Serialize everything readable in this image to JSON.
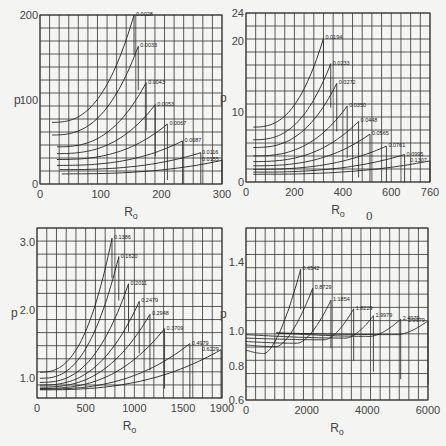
{
  "chart_data": [
    {
      "type": "line",
      "panel": "top-left",
      "xlabel": "R_o",
      "ylabel": "p",
      "xlim": [
        0,
        300
      ],
      "ylim": [
        0,
        200
      ],
      "xticks": [
        "0",
        "100",
        "200",
        "300"
      ],
      "yticks": [
        "0",
        "100",
        "200"
      ],
      "grid": true,
      "box": {
        "x0": 40,
        "y0": 15,
        "x1": 222,
        "y1": 184
      },
      "series": [
        {
          "name": "0.0028",
          "x0": 20,
          "xend": 155,
          "ystart": 73,
          "yend": 200
        },
        {
          "name": "0.0033",
          "x0": 20,
          "xend": 162,
          "ystart": 58,
          "yend": 163
        },
        {
          "name": "0.0043",
          "x0": 28,
          "xend": 175,
          "ystart": 44,
          "yend": 120
        },
        {
          "name": "0.0053",
          "x0": 28,
          "xend": 190,
          "ystart": 36,
          "yend": 94
        },
        {
          "name": "0.0067",
          "x0": 28,
          "xend": 210,
          "ystart": 29,
          "yend": 71
        },
        {
          "name": "0.0087",
          "x0": 28,
          "xend": 235,
          "ystart": 22,
          "yend": 51
        },
        {
          "name": "0.0116",
          "x0": 33,
          "xend": 265,
          "ystart": 17,
          "yend": 37
        },
        {
          "name": "0.0155",
          "x0": 36,
          "xend": 300,
          "ystart": 12,
          "yend": 28
        }
      ]
    },
    {
      "type": "line",
      "panel": "top-right",
      "xlabel": "R_o",
      "ylabel": "p",
      "xlim": [
        0,
        760
      ],
      "ylim": [
        0,
        24
      ],
      "xticks": [
        "0",
        "200",
        "400",
        "600",
        "760"
      ],
      "yticks": [
        "0",
        "10",
        "20",
        "24"
      ],
      "grid": true,
      "box": {
        "x0": 246,
        "y0": 13,
        "x1": 430,
        "y1": 182
      },
      "series": [
        {
          "name": "0.0194",
          "x0": 30,
          "xend": 320,
          "ystart": 7.8,
          "yend": 20.4
        },
        {
          "name": "0.0233",
          "x0": 30,
          "xend": 350,
          "ystart": 6.0,
          "yend": 16.8
        },
        {
          "name": "0.0272",
          "x0": 30,
          "xend": 375,
          "ystart": 4.9,
          "yend": 14.0
        },
        {
          "name": "0.0350",
          "x0": 30,
          "xend": 418,
          "ystart": 3.7,
          "yend": 10.8
        },
        {
          "name": "0.0448",
          "x0": 30,
          "xend": 465,
          "ystart": 2.9,
          "yend": 8.6
        },
        {
          "name": "0.0565",
          "x0": 30,
          "xend": 512,
          "ystart": 2.3,
          "yend": 6.8
        },
        {
          "name": "0.0761",
          "x0": 30,
          "xend": 580,
          "ystart": 1.8,
          "yend": 5.1
        },
        {
          "name": "0.0995",
          "x0": 30,
          "xend": 655,
          "ystart": 1.4,
          "yend": 3.9
        },
        {
          "name": "0.1307",
          "x0": 30,
          "xend": 760,
          "ystart": 1.1,
          "yend": 3.0
        }
      ]
    },
    {
      "type": "line",
      "panel": "bottom-left",
      "xlabel": "R_o",
      "ylabel": "p",
      "xlim": [
        0,
        1900
      ],
      "ylim": [
        0.7,
        3.2
      ],
      "xticks": [
        "0",
        "500",
        "1000",
        "1500",
        "1900"
      ],
      "yticks": [
        "1.0",
        "2.0",
        "3.0"
      ],
      "grid": true,
      "box": {
        "x0": 37,
        "y0": 228,
        "x1": 222,
        "y1": 398
      },
      "series": [
        {
          "name": "0.1386",
          "x0": 30,
          "xend": 770,
          "ystart": 1.08,
          "yend": 3.05
        },
        {
          "name": "0.1620",
          "x0": 30,
          "xend": 840,
          "ystart": 0.99,
          "yend": 2.78
        },
        {
          "name": "0.2011",
          "x0": 30,
          "xend": 940,
          "ystart": 0.93,
          "yend": 2.38
        },
        {
          "name": "0.2479",
          "x0": 30,
          "xend": 1050,
          "ystart": 0.89,
          "yend": 2.12
        },
        {
          "name": "0.2948",
          "x0": 30,
          "xend": 1160,
          "ystart": 0.86,
          "yend": 1.93
        },
        {
          "name": "0.3709",
          "x0": 30,
          "xend": 1310,
          "ystart": 0.84,
          "yend": 1.72
        },
        {
          "name": "0.4979",
          "x0": 30,
          "xend": 1570,
          "ystart": 0.83,
          "yend": 1.5
        },
        {
          "name": "0.6229",
          "x0": 30,
          "xend": 1890,
          "ystart": 0.82,
          "yend": 1.41
        }
      ]
    },
    {
      "type": "line",
      "panel": "bottom-right",
      "xlabel": "R_o",
      "ylabel": "p",
      "xlim": [
        0,
        6000
      ],
      "ylim": [
        0.6,
        1.6
      ],
      "xticks": [
        "0",
        "2000",
        "4000",
        "6000"
      ],
      "yticks": [
        "0.6",
        "0.8",
        "1.0",
        "1.4"
      ],
      "grid": true,
      "box": {
        "x0": 246,
        "y0": 228,
        "x1": 428,
        "y1": 400
      },
      "series": [
        {
          "name": "0.6542",
          "x0": 0,
          "xmin": 600,
          "ymin": 0.87,
          "xend": 1800,
          "ystart": 0.89,
          "yend": 1.36
        },
        {
          "name": "0.8729",
          "x0": 0,
          "xmin": 1000,
          "ymin": 0.91,
          "xend": 2200,
          "ystart": 0.92,
          "yend": 1.25
        },
        {
          "name": "1.1854",
          "x0": 0,
          "xmin": 1700,
          "ymin": 0.93,
          "xend": 2800,
          "ystart": 0.94,
          "yend": 1.18
        },
        {
          "name": "1.8229",
          "x0": 0,
          "xmin": 2600,
          "ymin": 0.95,
          "xend": 3550,
          "ystart": 0.96,
          "yend": 1.13
        },
        {
          "name": "1.9979",
          "x0": 0,
          "xmin": 3300,
          "ymin": 0.96,
          "xend": 4200,
          "ystart": 0.98,
          "yend": 1.09
        },
        {
          "name": "2.4979",
          "x0": 1000,
          "xmin": 4100,
          "ymin": 0.97,
          "xend": 5100,
          "ystart": 0.99,
          "yend": 1.07
        },
        {
          "name": "2.9979",
          "x0": 1000,
          "xmin": 5000,
          "ymin": 0.98,
          "xend": 6000,
          "ystart": 0.99,
          "yend": 1.06
        }
      ]
    }
  ],
  "stray_label": "0"
}
